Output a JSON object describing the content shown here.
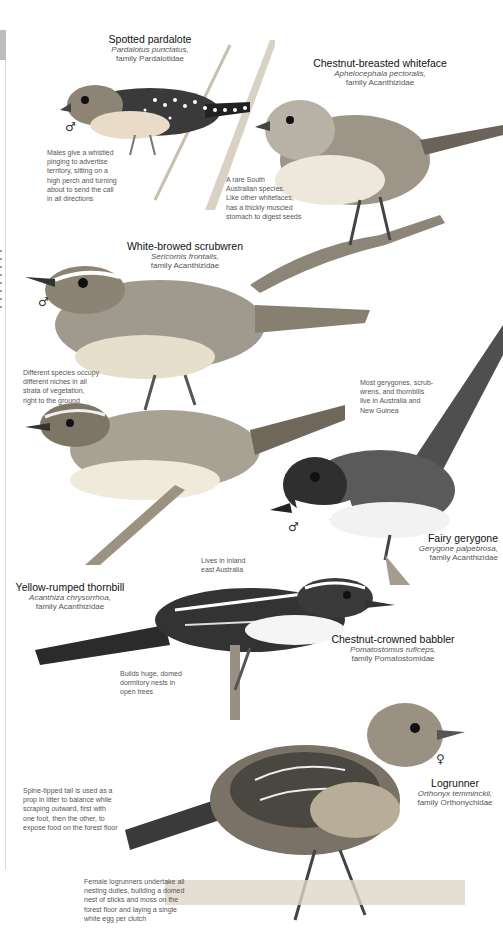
{
  "birds": [
    {
      "name": "Spotted pardalote",
      "scientific": "Pardalotus punctatus,",
      "family": "family Pardalotidae",
      "sex": "♂",
      "note": [
        "Males give a whistled",
        "pinging to advertise",
        "territory, sitting on a",
        "high perch and turning",
        "about to send the call",
        "in all directions"
      ]
    },
    {
      "name": "Chestnut-breasted whiteface",
      "scientific": "Aphelocephala pectoralis,",
      "family": "family Acanthizidae",
      "note": [
        "A rare South",
        "Australian species.",
        "Like other whitefaces,",
        "has a thickly muscled",
        "stomach to digest seeds"
      ]
    },
    {
      "name": "White-browed scrubwren",
      "scientific": "Sericornis frontalis,",
      "family": "family Acanthizidae",
      "sex": "♂",
      "note": [
        "Different species occupy",
        "different niches in all",
        "strata of vegetation,",
        "right to the ground"
      ]
    },
    {
      "name": "Fairy gerygone",
      "scientific": "Gerygone palpebrosa,",
      "family": "family Acanthizidae",
      "sex": "♂",
      "note": [
        "Most gerygones, scrub-",
        "wrens, and thornbills",
        "live in Australia and",
        "New Guinea"
      ]
    },
    {
      "name": "Yellow-rumped thornbill",
      "scientific": "Acanthiza chrysorrhoa,",
      "family": "family Acanthizidae",
      "note": [
        "Lives in inland",
        "east Australia"
      ]
    },
    {
      "name": "Chestnut-crowned babbler",
      "scientific": "Pomatostomus ruficeps,",
      "family": "family Pomatostomidae",
      "note": [
        "Builds huge, domed",
        "dormitory nests in",
        "open trees"
      ]
    },
    {
      "name": "Logrunner",
      "scientific": "Orthonyx temminckii,",
      "family": "family Orthonychidae",
      "sex": "♀",
      "note": [
        "Spine-tipped tail is used as a",
        "prop in litter to balance while",
        "scraping outward, first with",
        "one foot, then the other, to",
        "expose food on the forest floor"
      ],
      "note2": [
        "Female logrunners undertake all",
        "nesting duties, building a domed",
        "nest of sticks and moss on the",
        "forest floor and laying a single",
        "white egg per clutch"
      ]
    }
  ],
  "colors": {
    "ink": "#222222",
    "caption": "#555555",
    "rule": "#d8d8d8"
  }
}
